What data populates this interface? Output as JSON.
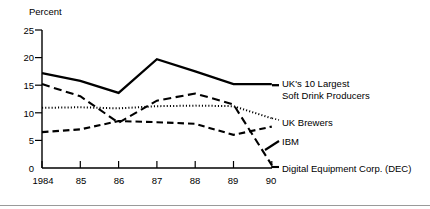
{
  "chart_data": {
    "type": "line",
    "title": "",
    "ylabel": "Percent",
    "xlabel": "",
    "categories": [
      "1984",
      "85",
      "86",
      "87",
      "88",
      "89",
      "90"
    ],
    "x": [
      1984,
      1985,
      1986,
      1987,
      1988,
      1989,
      1990
    ],
    "ylim": [
      0,
      25
    ],
    "yticks": [
      0,
      5,
      10,
      15,
      20,
      25
    ],
    "grid": false,
    "legend_position": "right-inline",
    "series": [
      {
        "name": "UK's 10 Largest Soft Drink Producers",
        "style": "solid",
        "values": [
          17.2,
          15.8,
          13.6,
          19.7,
          17.5,
          15.2,
          15.2
        ]
      },
      {
        "name": "UK Brewers",
        "style": "dotted",
        "values": [
          10.9,
          11.0,
          10.8,
          11.2,
          11.3,
          11.2,
          9.0
        ]
      },
      {
        "name": "IBM",
        "style": "long-dash",
        "values": [
          15.2,
          13.0,
          8.2,
          12.2,
          13.5,
          11.5,
          0.5
        ]
      },
      {
        "name": "Digital Equipment Corp. (DEC)",
        "style": "dash",
        "values": [
          6.5,
          7.0,
          8.5,
          8.3,
          8.0,
          6.0,
          7.5
        ]
      }
    ]
  },
  "axis": {
    "y_title": "Percent",
    "y_ticks": [
      "25",
      "20",
      "15",
      "10",
      "5",
      "0"
    ],
    "x_ticks": [
      "1984",
      "85",
      "86",
      "87",
      "88",
      "89",
      "90"
    ]
  },
  "legend": {
    "soft_drink_line1": "UK's 10 Largest",
    "soft_drink_line2": "Soft Drink Producers",
    "brewers": "UK Brewers",
    "ibm": "IBM",
    "dec": "Digital Equipment Corp. (DEC)"
  },
  "colors": {
    "ink": "#000000",
    "background": "#ffffff",
    "rule": "#9a9a9a"
  }
}
